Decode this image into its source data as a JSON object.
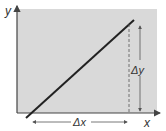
{
  "diagram": {
    "axes": {
      "x_label": "x",
      "y_label": "y"
    },
    "annotations": {
      "delta_x": "Δx",
      "delta_y": "Δy"
    },
    "colors": {
      "plot_bg": "#d9d9d9",
      "line": "#222222",
      "axis": "#444444",
      "arrow": "#555555"
    }
  }
}
